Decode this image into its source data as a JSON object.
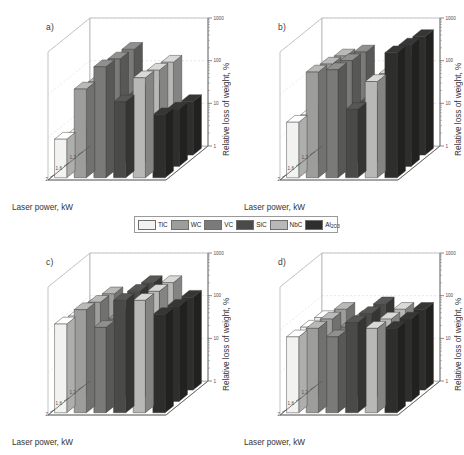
{
  "figure": {
    "axis_titles": {
      "x": "Laser power, kW",
      "y": "Relative loss of weight, %"
    },
    "panel_labels": {
      "a": "a)",
      "b": "b)",
      "c": "c)",
      "d": "d)"
    }
  },
  "legend": {
    "position": "center-between-rows",
    "entries": [
      {
        "label": "TiC",
        "sub": "",
        "color": "#f2f2f0"
      },
      {
        "label": "WC",
        "sub": "",
        "color": "#9d9d9b"
      },
      {
        "label": "VC",
        "sub": "",
        "color": "#7a7a78"
      },
      {
        "label": "SiC",
        "sub": "",
        "color": "#4a4a49"
      },
      {
        "label": "NbC",
        "sub": "",
        "color": "#b8b8b6"
      },
      {
        "label": "Al",
        "sub": "2O3",
        "color": "#2e2e2d"
      }
    ]
  },
  "chart_data": [
    {
      "id": "a",
      "type": "bar",
      "title": "a)",
      "xlabel": "Laser power, kW",
      "ylabel": "Relative loss of weight, %",
      "xticks": [
        "2",
        "1.6",
        "1.2"
      ],
      "yticks": [
        "1000",
        "100",
        "10",
        "1"
      ],
      "ylim": [
        1,
        1000
      ],
      "yscale": "log",
      "grid": true,
      "categories": [
        "TiC",
        "WC",
        "VC",
        "SiC",
        "NbC",
        "Al2O3"
      ],
      "series": [
        {
          "name": "2",
          "values": [
            8,
            120,
            400,
            60,
            220,
            30
          ]
        },
        {
          "name": "1.6",
          "values": [
            6,
            95,
            330,
            45,
            180,
            22
          ]
        },
        {
          "name": "1.2",
          "values": [
            5,
            80,
            300,
            38,
            150,
            18
          ]
        }
      ]
    },
    {
      "id": "b",
      "type": "bar",
      "title": "b)",
      "xlabel": "Laser power, kW",
      "ylabel": "Relative loss of weight, %",
      "xticks": [
        "2",
        "1.6",
        "1.2"
      ],
      "yticks": [
        "1000",
        "100",
        "10",
        "1"
      ],
      "ylim": [
        1,
        1000
      ],
      "yscale": "log",
      "grid": true,
      "categories": [
        "TiC",
        "WC",
        "VC",
        "SiC",
        "NbC",
        "Al2O3"
      ],
      "series": [
        {
          "name": "2",
          "values": [
            20,
            300,
            340,
            40,
            180,
            850
          ]
        },
        {
          "name": "1.6",
          "values": [
            16,
            250,
            300,
            32,
            150,
            700
          ]
        },
        {
          "name": "1.2",
          "values": [
            14,
            210,
            260,
            28,
            130,
            600
          ]
        }
      ]
    },
    {
      "id": "c",
      "type": "bar",
      "title": "c)",
      "xlabel": "Laser power, kW",
      "ylabel": "Relative loss of weight, %",
      "xticks": [
        "2",
        "1.6",
        "1.2"
      ],
      "yticks": [
        "1000",
        "100",
        "10",
        "1"
      ],
      "ylim": [
        1,
        1000
      ],
      "yscale": "log",
      "grid": true,
      "categories": [
        "TiC",
        "WC",
        "VC",
        "SiC",
        "NbC",
        "Al2O3"
      ],
      "series": [
        {
          "name": "2",
          "values": [
            120,
            260,
            100,
            430,
            430,
            200
          ]
        },
        {
          "name": "1.6",
          "values": [
            100,
            210,
            85,
            380,
            380,
            170
          ]
        },
        {
          "name": "1.2",
          "values": [
            90,
            180,
            75,
            330,
            330,
            150
          ]
        }
      ]
    },
    {
      "id": "d",
      "type": "bar",
      "title": "d)",
      "xlabel": "Laser power, kW",
      "ylabel": "Relative loss of weight, %",
      "xticks": [
        "2",
        "1.6",
        "1.2"
      ],
      "yticks": [
        "1000",
        "100",
        "10",
        "1"
      ],
      "ylim": [
        1,
        1000
      ],
      "yscale": "log",
      "grid": true,
      "categories": [
        "TiC",
        "WC",
        "VC",
        "SiC",
        "NbC",
        "Al2O3"
      ],
      "series": [
        {
          "name": "2",
          "values": [
            60,
            95,
            60,
            130,
            95,
            95
          ]
        },
        {
          "name": "1.6",
          "values": [
            55,
            85,
            55,
            115,
            85,
            85
          ]
        },
        {
          "name": "1.2",
          "values": [
            50,
            78,
            50,
            105,
            78,
            78
          ]
        }
      ]
    }
  ]
}
